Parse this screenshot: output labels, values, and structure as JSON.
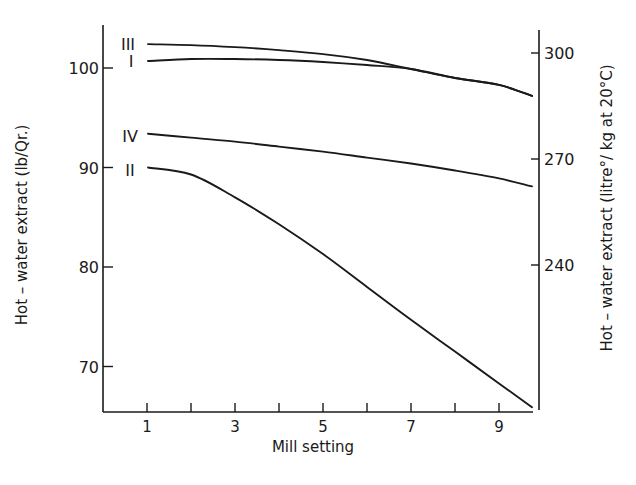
{
  "chart_data": {
    "type": "line",
    "title": "",
    "xlabel": "Mill setting",
    "ylabel": "Hot - water extract (lb/Qr.)",
    "ylabel_right": "Hot - water extract (litre°/ kg at 20°C)",
    "x_ticks": [
      1,
      2,
      3,
      4,
      5,
      6,
      7,
      8,
      9
    ],
    "x_tick_labels": [
      "1",
      "3",
      "5",
      "7",
      "9"
    ],
    "xlim": [
      0,
      9.75
    ],
    "y_ticks": [
      70,
      80,
      90,
      100
    ],
    "y_tick_labels": [
      "70",
      "80",
      "90",
      "100"
    ],
    "ylim": [
      65.5,
      104.5
    ],
    "y_right_ticks": [
      240,
      270,
      300
    ],
    "y_right_tick_labels": [
      "240",
      "270",
      "300"
    ],
    "grid": false,
    "legend": "inline curve labels at left",
    "x": [
      1,
      2,
      3,
      4,
      5,
      6,
      7,
      8,
      9,
      9.75
    ],
    "series": [
      {
        "name": "III",
        "values": [
          102.4,
          102.3,
          102.1,
          101.8,
          101.4,
          100.8,
          99.9,
          99.0,
          98.3,
          97.2
        ]
      },
      {
        "name": "I",
        "values": [
          100.7,
          100.9,
          100.9,
          100.8,
          100.6,
          100.3,
          99.9,
          99.0,
          98.3,
          97.2
        ]
      },
      {
        "name": "IV",
        "values": [
          93.4,
          93.0,
          92.6,
          92.1,
          91.6,
          91.0,
          90.4,
          89.7,
          88.9,
          88.1
        ]
      },
      {
        "name": "II",
        "values": [
          90.0,
          89.3,
          87.0,
          84.3,
          81.3,
          78.0,
          74.7,
          71.5,
          68.3,
          65.9
        ]
      }
    ]
  },
  "labels": {
    "xlabel": "Mill setting",
    "ylabel_left": "Hot – water   extract  (lb/Qr.)",
    "ylabel_right": "Hot – water   extract  (litre°/ kg  at  20°C)"
  }
}
